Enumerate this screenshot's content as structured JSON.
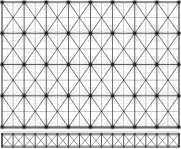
{
  "document": {
    "title": "Space Frame Roof Plan and Truss Elevation",
    "canvas": {
      "width": 181,
      "height": 149
    },
    "background_color": "#ffffff",
    "line_color": "#555555",
    "heavy_line_color": "#222222",
    "node_color": "#1a1a1a",
    "faint_line_color": "#aaaaaa"
  },
  "plan_view": {
    "name": "roof-grid-plan",
    "bounds": {
      "x": 2,
      "y": 2,
      "width": 177,
      "height": 125
    },
    "columns": 8,
    "rows": 4,
    "column_x": [
      2,
      24.125,
      46.25,
      68.375,
      90.5,
      112.625,
      134.75,
      156.875,
      179
    ],
    "row_y": [
      2,
      33.25,
      64.5,
      95.75,
      127
    ],
    "bay_width": 22.125,
    "bay_height": 31.25,
    "cell_features": [
      "x-diagonals",
      "mid-horizontal",
      "mid-vertical",
      "corner-radiating-fan",
      "node-cluster"
    ],
    "fan_rays_per_node": 8,
    "fan_radius": 11,
    "node_radius": 1.6
  },
  "elevation_view": {
    "name": "truss-elevation",
    "bounds": {
      "x": 2,
      "y": 133,
      "width": 177,
      "height": 15
    },
    "bays": 16,
    "top_chord_y": 134,
    "bottom_chord_y": 147,
    "panel_width": 11.0625,
    "web_pattern": "x-braced-with-verticals",
    "has_top_chord": true,
    "has_bottom_chord": true
  },
  "separator": {
    "name": "view-separator-band",
    "y": 128,
    "height": 4
  },
  "chart_data": {
    "type": "diagram",
    "title": "Space Frame Roof Plan and Truss Elevation",
    "subtitle": "",
    "views": [
      {
        "label": "Plan",
        "grid_columns": 8,
        "grid_rows": 4,
        "total_nodes": 45,
        "bracing": "cross (X) in every bay"
      },
      {
        "label": "Elevation",
        "panels": 16,
        "depth": 13,
        "bracing": "cross (X) with verticals"
      }
    ]
  }
}
